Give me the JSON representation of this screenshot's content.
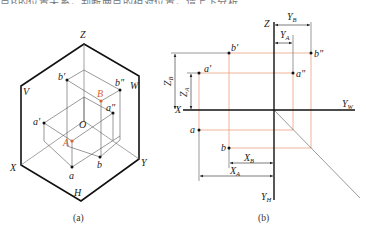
{
  "top_text": "点B的位置关系，判断两点的相对位置，请上下分析",
  "figure_a": {
    "caption": "(a)",
    "plane_labels": {
      "V": "V",
      "W": "W",
      "H": "H"
    },
    "axis_labels": {
      "Z": "Z",
      "X": "X",
      "Y": "Y",
      "O": "O"
    },
    "points": {
      "b_prime": "b'",
      "b_dprime": "b\"",
      "a_prime": "a'",
      "a_dprime": "a\"",
      "a": "a",
      "b": "b",
      "A": "A",
      "B": "B"
    }
  },
  "figure_b": {
    "caption": "(b)",
    "axis_labels": {
      "Z": "Z",
      "X": "X",
      "Yw": "Y",
      "Yw_sub": "W",
      "Yh": "Y",
      "Yh_sub": "H"
    },
    "points": {
      "b_prime": "b'",
      "b_dprime": "b\"",
      "a_prime": "a'",
      "a_dprime": "a\"",
      "a": "a",
      "b": "b"
    },
    "dimensions": {
      "YB": {
        "main": "Y",
        "sub": "B"
      },
      "YA": {
        "main": "Y",
        "sub": "A"
      },
      "ZB": {
        "main": "Z",
        "sub": "B"
      },
      "ZA": {
        "main": "Z",
        "sub": "A"
      },
      "XB": {
        "main": "X",
        "sub": "B"
      },
      "XA": {
        "main": "X",
        "sub": "A"
      }
    }
  },
  "colors": {
    "projection_line": "#e8956a",
    "axis": "#111111",
    "thin": "#555555",
    "accent": "#d9622b"
  }
}
